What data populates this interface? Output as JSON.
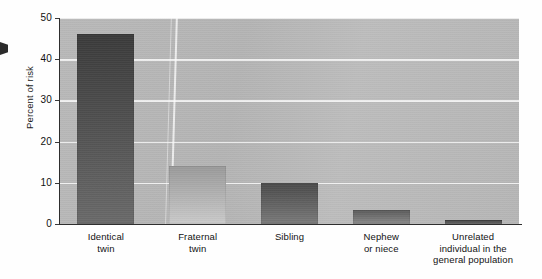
{
  "chart_data": {
    "type": "bar",
    "title": "",
    "xlabel": "",
    "ylabel": "Percent of risk",
    "ylim": [
      0,
      50
    ],
    "yticks": [
      0,
      10,
      20,
      30,
      40,
      50
    ],
    "ytick_labels": [
      "0",
      "10",
      "20",
      "30",
      "40",
      "50"
    ],
    "grid": "horizontal",
    "legend": "none",
    "categories": [
      "Identical twin",
      "Fraternal twin",
      "Sibling",
      "Nephew or niece",
      "Unrelated individual in the general population"
    ],
    "category_lines": [
      [
        "Identical",
        "twin"
      ],
      [
        "Fraternal",
        "twin"
      ],
      [
        "Sibling"
      ],
      [
        "Nephew",
        "or niece"
      ],
      [
        "Unrelated",
        "individual in the",
        "general population"
      ]
    ],
    "values": [
      46,
      14,
      10,
      3.5,
      1
    ],
    "bar_colors": [
      "#3a3a3a",
      "#9a9a9a",
      "#4a4a4a",
      "#5a5a5a",
      "#3d3d3d"
    ],
    "plot_background": "#b7b7b7",
    "gridline_color": "#f2f2f2",
    "axis_color": "#2e2e2e"
  }
}
